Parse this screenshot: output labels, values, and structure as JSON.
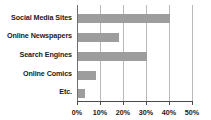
{
  "chart_data": {
    "type": "bar",
    "orientation": "horizontal",
    "title": "",
    "xlabel": "",
    "ylabel": "",
    "categories": [
      "Social Media Sites",
      "Online Newspapers",
      "Search Engines",
      "Online Comics",
      "Etc."
    ],
    "values": [
      40,
      18,
      30,
      8,
      3
    ],
    "value_unit": "%",
    "xlim": [
      0,
      50
    ],
    "xticks": [
      0,
      10,
      20,
      30,
      40,
      50
    ],
    "xtick_labels": [
      "0%",
      "10%",
      "20%",
      "30%",
      "40%",
      "50%"
    ],
    "grid": "vertical",
    "legend": "none",
    "series": [
      {
        "name": "",
        "values": [
          40,
          18,
          30,
          8,
          3
        ]
      }
    ],
    "colors": {
      "bar": "#9d9d9d",
      "gridline": "#b9b9b9",
      "axis": "#4a4a4a",
      "text": "#1a1a1a",
      "background": "#ffffff"
    }
  }
}
